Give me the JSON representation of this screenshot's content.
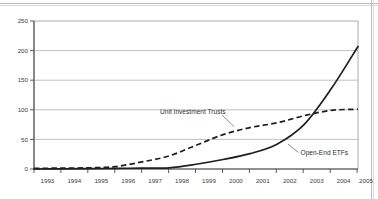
{
  "chart_data": {
    "type": "line",
    "title": "",
    "subtitle": "",
    "xlabel": "",
    "ylabel": "",
    "x": [
      1993,
      1994,
      1995,
      1996,
      1997,
      1998,
      1999,
      2000,
      2001,
      2002,
      2003,
      2004,
      2005
    ],
    "categories": [
      "1993",
      "1994",
      "1995",
      "1996",
      "1997",
      "1998",
      "1999",
      "2000",
      "2001",
      "2002",
      "2003",
      "2004",
      "2005"
    ],
    "xlim": [
      1993,
      2005
    ],
    "ylim": [
      0,
      250
    ],
    "yticks": [
      0,
      50,
      100,
      150,
      200,
      250
    ],
    "ytick_labels": [
      "0",
      "50",
      "100",
      "150",
      "200",
      "250"
    ],
    "xticks": [
      1993,
      1994,
      1995,
      1996,
      1997,
      1998,
      1999,
      2000,
      2001,
      2002,
      2003,
      2004,
      2005
    ],
    "xtick_labels": [
      "1993",
      "1994",
      "1995",
      "1996",
      "1997",
      "1998",
      "1999",
      "2000",
      "2001",
      "2002",
      "2003",
      "2004",
      "2005"
    ],
    "grid": true,
    "grid_axis": "y",
    "legend": "inline-annotations",
    "legend_position": "inline",
    "series": [
      {
        "name": "Unit Investment Trusts",
        "style": "dashed",
        "color": "#1f1f1f",
        "values": [
          1,
          1.5,
          2,
          4,
          12,
          22,
          40,
          58,
          70,
          78,
          90,
          99,
          101
        ]
      },
      {
        "name": "Open-End ETFs",
        "style": "solid",
        "color": "#1f1f1f",
        "values": [
          0,
          0.2,
          0.5,
          1,
          1.5,
          2,
          8,
          16,
          26,
          42,
          75,
          135,
          207
        ]
      }
    ],
    "annotations": [
      {
        "text": "Unit Investment Trusts",
        "series": "Unit Investment Trusts",
        "points_to_year": 2000
      },
      {
        "text": "Open-End ETFs",
        "series": "Open-End ETFs",
        "points_to_year": 2002
      }
    ]
  },
  "axes": {
    "y_labels": [
      "250",
      "200",
      "150",
      "100",
      "50",
      "0"
    ],
    "x_labels": [
      "1993",
      "1994",
      "1995",
      "1996",
      "1997",
      "1998",
      "1999",
      "2000",
      "2001",
      "2002",
      "2003",
      "2004",
      "2005"
    ]
  },
  "labels": {
    "series_uit": "Unit Investment Trusts",
    "series_etf": "Open-End ETFs"
  },
  "colors": {
    "line": "#1f1f1f",
    "grid": "#a9a9a9",
    "axis": "#4a4a4a",
    "text": "#3b3b3b",
    "background": "#ffffff"
  }
}
